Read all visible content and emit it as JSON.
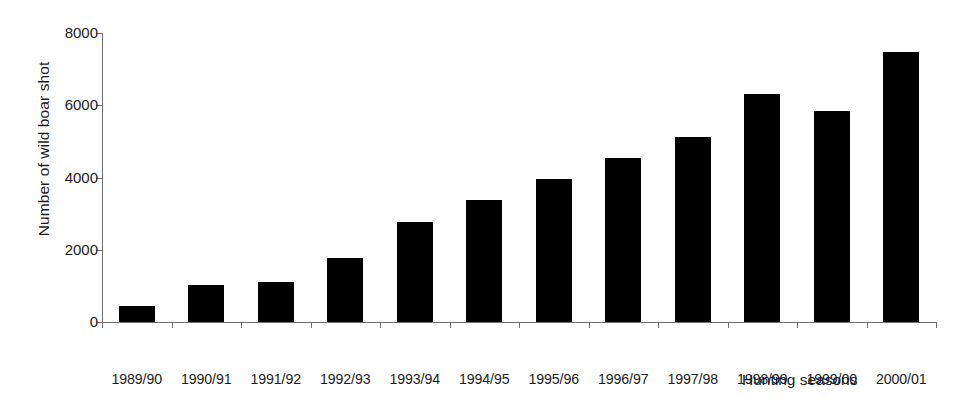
{
  "chart_data": {
    "type": "bar",
    "title": "",
    "xlabel": "Hunting seasons",
    "ylabel": "Number of wild boar shot",
    "categories": [
      "1989/90",
      "1990/91",
      "1991/92",
      "1992/93",
      "1993/94",
      "1994/95",
      "1995/96",
      "1996/97",
      "1997/98",
      "1998/99",
      "1999/00",
      "2000/01"
    ],
    "values": [
      430,
      1020,
      1100,
      1770,
      2770,
      3380,
      3970,
      4530,
      5110,
      6320,
      5840,
      7470
    ],
    "ylim": [
      0,
      8000
    ],
    "ytick_values": [
      0,
      2000,
      4000,
      6000,
      8000
    ],
    "ytick_labels": [
      "0",
      "2000",
      "4000",
      "6000",
      "8000"
    ],
    "grid": false,
    "legend": null,
    "bar_color": "#000000",
    "axis_color": "#6e6e6e",
    "background": "#ffffff"
  },
  "axes": {
    "y_title": "Number of wild boar shot",
    "x_title": "Hunting seasons"
  }
}
